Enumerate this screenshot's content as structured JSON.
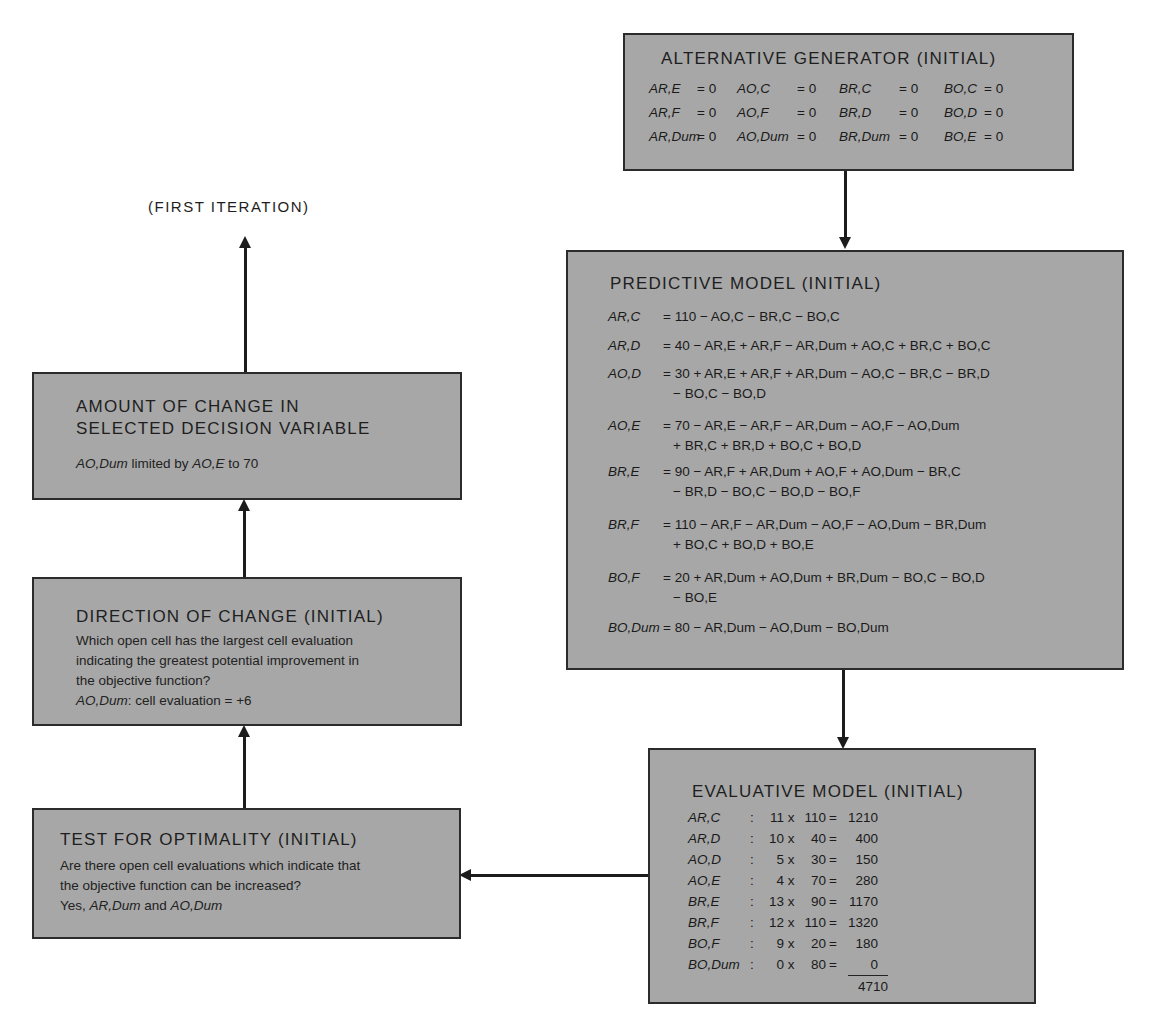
{
  "iteration_label": "(FIRST ITERATION)",
  "alternative_generator": {
    "title": "ALTERNATIVE GENERATOR (INITIAL)",
    "rows": [
      [
        {
          "var": "AR,E",
          "val": "= 0"
        },
        {
          "var": "AO,C",
          "val": "= 0"
        },
        {
          "var": "BR,C",
          "val": "= 0"
        },
        {
          "var": "BO,C",
          "val": "= 0"
        }
      ],
      [
        {
          "var": "AR,F",
          "val": "= 0"
        },
        {
          "var": "AO,F",
          "val": "= 0"
        },
        {
          "var": "BR,D",
          "val": "= 0"
        },
        {
          "var": "BO,D",
          "val": "= 0"
        }
      ],
      [
        {
          "var": "AR,Dum",
          "val": "= 0"
        },
        {
          "var": "AO,Dum",
          "val": "= 0"
        },
        {
          "var": "BR,Dum",
          "val": "= 0"
        },
        {
          "var": "BO,E",
          "val": "= 0"
        }
      ]
    ]
  },
  "predictive_model": {
    "title": "PREDICTIVE MODEL (INITIAL)",
    "equations": [
      {
        "lhs": "AR,C",
        "line1": "= 110 − AO,C − BR,C − BO,C",
        "line2": ""
      },
      {
        "lhs": "AR,D",
        "line1": "= 40 − AR,E + AR,F − AR,Dum + AO,C + BR,C + BO,C",
        "line2": ""
      },
      {
        "lhs": "AO,D",
        "line1": "= 30 + AR,E + AR,F + AR,Dum − AO,C − BR,C − BR,D",
        "line2": "− BO,C − BO,D"
      },
      {
        "lhs": "AO,E",
        "line1": "= 70 − AR,E − AR,F − AR,Dum − AO,F − AO,Dum",
        "line2": "+ BR,C + BR,D + BO,C + BO,D"
      },
      {
        "lhs": "BR,E",
        "line1": "= 90 − AR,F + AR,Dum + AO,F + AO,Dum − BR,C",
        "line2": "− BR,D − BO,C − BO,D − BO,F"
      },
      {
        "lhs": "BR,F",
        "line1": "= 110 − AR,F − AR,Dum − AO,F − AO,Dum − BR,Dum",
        "line2": "+ BO,C + BO,D + BO,E"
      },
      {
        "lhs": "BO,F",
        "line1": "= 20 + AR,Dum + AO,Dum + BR,Dum − BO,C − BO,D",
        "line2": "− BO,E"
      },
      {
        "lhs": "BO,Dum",
        "line1": "= 80 − AR,Dum − AO,Dum − BO,Dum",
        "line2": ""
      }
    ]
  },
  "evaluative_model": {
    "title": "EVALUATIVE MODEL (INITIAL)",
    "rows": [
      {
        "var": "AR,C",
        "coef": "11",
        "qty": "110",
        "product": "1210"
      },
      {
        "var": "AR,D",
        "coef": "10",
        "qty": "40",
        "product": "400"
      },
      {
        "var": "AO,D",
        "coef": "5",
        "qty": "30",
        "product": "150"
      },
      {
        "var": "AO,E",
        "coef": "4",
        "qty": "70",
        "product": "280"
      },
      {
        "var": "BR,E",
        "coef": "13",
        "qty": "90",
        "product": "1170"
      },
      {
        "var": "BR,F",
        "coef": "12",
        "qty": "110",
        "product": "1320"
      },
      {
        "var": "BO,F",
        "coef": "9",
        "qty": "20",
        "product": "180"
      },
      {
        "var": "BO,Dum",
        "coef": "0",
        "qty": "80",
        "product": "0"
      }
    ],
    "total": "4710",
    "colon": ":",
    "times": "x",
    "equals": "="
  },
  "test_for_optimality": {
    "title": "TEST FOR OPTIMALITY (INITIAL)",
    "line1": "Are there open cell evaluations which indicate that",
    "line2": "the objective function can be increased?",
    "answer_prefix": "Yes, ",
    "answer_var1": "AR,Dum",
    "answer_mid": " and ",
    "answer_var2": "AO,Dum"
  },
  "direction_of_change": {
    "title": "DIRECTION OF CHANGE (INITIAL)",
    "line1": "Which open cell has the largest cell evaluation",
    "line2": "indicating the greatest potential improvement in",
    "line3": "the objective function?",
    "result_var": "AO,Dum",
    "result_text": ": cell evaluation = +6"
  },
  "amount_of_change": {
    "title_line1": "AMOUNT OF CHANGE IN",
    "title_line2": "SELECTED DECISION VARIABLE",
    "result_var1": "AO,Dum",
    "result_mid": " limited by ",
    "result_var2": "AO,E",
    "result_end": " to 70"
  }
}
